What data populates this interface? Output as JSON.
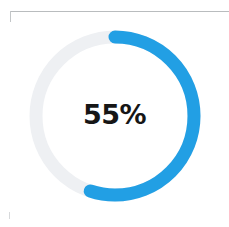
{
  "widget": {
    "name": "donut-progress-chart",
    "background_color": "#ffffff",
    "center_label": "55%",
    "center_label_color": "#161616"
  },
  "frame": {
    "rule_color": "#b9bcbe",
    "corner_stub_color": "#c3c6c8",
    "bottom_tick_color": "#d7d9db"
  },
  "chart_data": {
    "type": "pie",
    "variant": "donut",
    "title": "",
    "subtitle": "",
    "xlabel": "",
    "ylabel": "",
    "center_text": "55%",
    "categories": [
      "Completed",
      "Remaining"
    ],
    "values": [
      55,
      45
    ],
    "unit": "%",
    "total": 100,
    "colors": [
      "#229fe4",
      "#eef0f3"
    ],
    "series": [
      {
        "name": "Completed",
        "value": 55,
        "color": "#229fe4"
      },
      {
        "name": "Remaining",
        "value": 45,
        "color": "#eef0f3"
      }
    ],
    "start_angle_deg": 0,
    "sweep_deg": 198,
    "direction": "clockwise",
    "grid": false,
    "legend": false,
    "legend_position": "none",
    "geometry": {
      "center_x": 115,
      "center_y": 116,
      "radius": 79,
      "stroke_width": 13,
      "line_cap": "round"
    }
  }
}
